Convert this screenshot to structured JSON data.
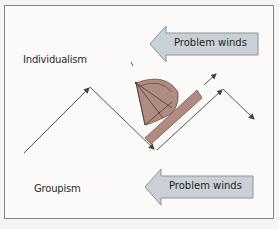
{
  "diagram": {
    "labels": {
      "top": "Individualism",
      "bottom": "Groupism"
    },
    "wind_arrows": [
      {
        "label": "Problem winds",
        "direction": "left",
        "icon": "left-arrow-icon"
      },
      {
        "label": "Problem winds",
        "direction": "left",
        "icon": "left-arrow-icon"
      }
    ],
    "icons": {
      "sailboat": "sailboat-icon",
      "zigzag_path": "zigzag-arrow-path-icon"
    },
    "colors": {
      "arrow_fill": "#c9d1d6",
      "arrow_stroke": "#8b9499",
      "sail_fill": "#b08b82",
      "sail_stroke": "#6e5550",
      "line": "#555555",
      "frame_border": "#8a8583"
    }
  }
}
